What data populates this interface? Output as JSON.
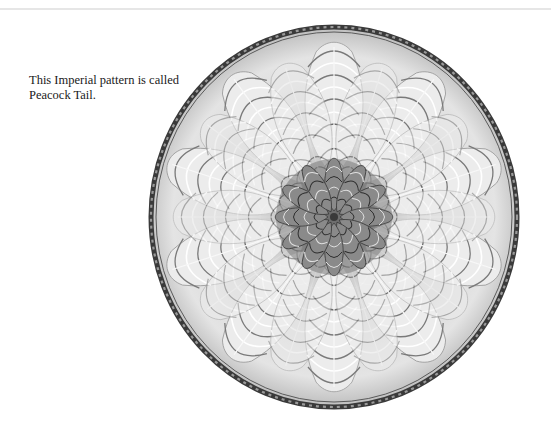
{
  "caption": {
    "line1": "This Imperial pattern is called",
    "line2": "Peacock Tail."
  },
  "figure": {
    "lobes": 10,
    "colors": {
      "rim": "#3a3a3a",
      "body": "#d9d9d9",
      "highlight": "#f6f6f6",
      "shadow": "#6e6e6e"
    }
  }
}
